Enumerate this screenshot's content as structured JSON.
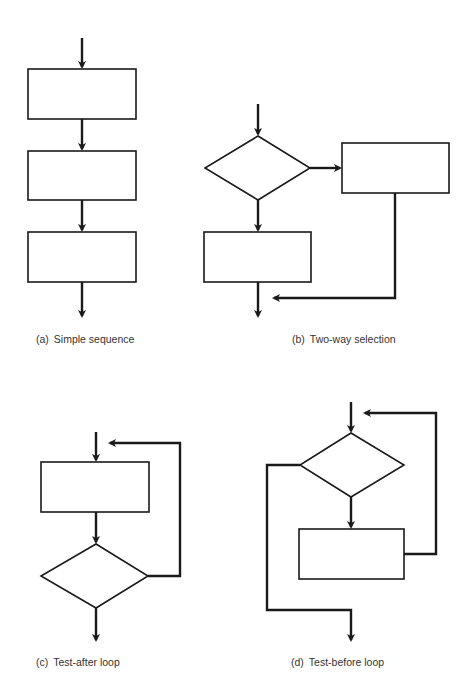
{
  "figure": {
    "stroke_color": "#1a1a1a",
    "panels": [
      {
        "id": "a",
        "label": "(a)",
        "title": "Simple sequence"
      },
      {
        "id": "b",
        "label": "(b)",
        "title": "Two-way selection"
      },
      {
        "id": "c",
        "label": "(c)",
        "title": "Test-after loop"
      },
      {
        "id": "d",
        "label": "(d)",
        "title": "Test-before loop"
      }
    ]
  }
}
